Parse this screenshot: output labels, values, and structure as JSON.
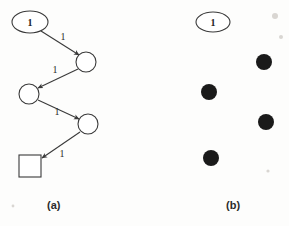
{
  "figure": {
    "background_color": "#fdfdfc",
    "ink_color": "#3a3a3a",
    "fill_color": "#1a1a1a",
    "panels": [
      {
        "id": "a",
        "caption": "(a)",
        "caption_position": {
          "x": 47,
          "y": 199
        },
        "description": "directed zigzag graph with labeled edges",
        "nodes": [
          {
            "id": "n1",
            "shape": "ellipse",
            "label": "1",
            "cx": 30,
            "cy": 22,
            "rx": 18,
            "ry": 11,
            "filled": false
          },
          {
            "id": "n2",
            "shape": "circle",
            "label": "",
            "cx": 86,
            "cy": 62,
            "r": 10,
            "filled": false
          },
          {
            "id": "n3",
            "shape": "circle",
            "label": "",
            "cx": 29,
            "cy": 94,
            "r": 10,
            "filled": false
          },
          {
            "id": "n4",
            "shape": "circle",
            "label": "",
            "cx": 88,
            "cy": 124,
            "r": 10,
            "filled": false
          },
          {
            "id": "n5",
            "shape": "square",
            "label": "",
            "cx": 30,
            "cy": 166,
            "size": 22,
            "filled": false
          }
        ],
        "edges": [
          {
            "from": "n1",
            "to": "n2",
            "label": "1",
            "label_x": 63,
            "label_y": 40,
            "directed": true
          },
          {
            "from": "n2",
            "to": "n3",
            "label": "1",
            "label_x": 55,
            "label_y": 73,
            "directed": true
          },
          {
            "from": "n3",
            "to": "n4",
            "label": "1",
            "label_x": 57,
            "label_y": 115,
            "directed": true
          },
          {
            "from": "n4",
            "to": "n5",
            "label": "1",
            "label_x": 62,
            "label_y": 157,
            "directed": true
          }
        ]
      },
      {
        "id": "b",
        "caption": "(b)",
        "caption_position": {
          "x": 226,
          "y": 199
        },
        "description": "same layout with unlabeled nodes drawn as solid dots and no edges",
        "nodes": [
          {
            "id": "m1",
            "shape": "ellipse",
            "label": "1",
            "cx": 213,
            "cy": 22,
            "rx": 17,
            "ry": 10,
            "filled": false
          },
          {
            "id": "m2",
            "shape": "circle",
            "label": "",
            "cx": 264,
            "cy": 62,
            "r": 8,
            "filled": true
          },
          {
            "id": "m3",
            "shape": "circle",
            "label": "",
            "cx": 209,
            "cy": 92,
            "r": 8,
            "filled": true
          },
          {
            "id": "m4",
            "shape": "circle",
            "label": "",
            "cx": 266,
            "cy": 122,
            "r": 8,
            "filled": true
          },
          {
            "id": "m5",
            "shape": "circle",
            "label": "",
            "cx": 211,
            "cy": 158,
            "r": 8,
            "filled": true
          }
        ],
        "edges": []
      }
    ],
    "specks": [
      {
        "cx": 275,
        "cy": 16,
        "r": 3
      },
      {
        "cx": 281,
        "cy": 37,
        "r": 2
      },
      {
        "cx": 268,
        "cy": 171,
        "r": 1.6
      },
      {
        "cx": 13,
        "cy": 206,
        "r": 1.4
      }
    ]
  }
}
